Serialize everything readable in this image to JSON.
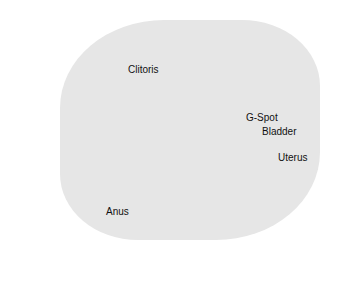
{
  "diagram": {
    "type": "anatomical illustration (medical, cross-section)",
    "labels": [
      "Clitoris",
      "G-Spot",
      "Bladder",
      "Uterus",
      "Anus"
    ]
  }
}
